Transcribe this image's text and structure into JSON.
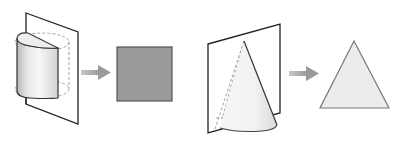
{
  "diagram": {
    "type": "cross-section illustration",
    "panels": [
      {
        "id": "cylinder",
        "solid": "cylinder (half shown, cut by vertical plane through axis)",
        "result_shape": "rectangle",
        "result_fill": "#9a9a9a",
        "result_stroke": "#555555"
      },
      {
        "id": "cone",
        "solid": "cone (half shown, cut by vertical plane through apex)",
        "result_shape": "triangle",
        "result_fill": "#ececec",
        "result_stroke": "#777777"
      }
    ],
    "colors": {
      "plane_stroke": "#222222",
      "dashed_hidden": "#9a9a9a",
      "arrow": "#a8a8a8",
      "background": "#ffffff"
    }
  }
}
